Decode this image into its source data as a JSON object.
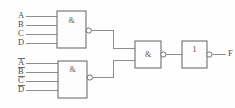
{
  "diagram": {
    "background_color": "#fefefe",
    "wire_color": "#8e8e8e",
    "gate_border_color": "#6f6f6f",
    "label_color": "#4a4a4a"
  },
  "gates": {
    "nand_top": {
      "symbol": "&",
      "name": "top-nand-gate",
      "inverted_output": true
    },
    "nand_bottom": {
      "symbol": "&",
      "name": "bottom-nand-gate",
      "inverted_output": true
    },
    "nand_mid": {
      "symbol": "&",
      "name": "middle-nand-gate",
      "inverted_output": true
    },
    "buffer_out": {
      "symbol": "1",
      "name": "output-buffer-gate",
      "inverted_output": true
    }
  },
  "inputs": {
    "top_group": [
      {
        "label": "A",
        "complement": false
      },
      {
        "label": "B",
        "complement": false
      },
      {
        "label": "C",
        "complement": false
      },
      {
        "label": "D",
        "complement": false
      }
    ],
    "bottom_group": [
      {
        "label": "A",
        "complement": true
      },
      {
        "label": "B",
        "complement": true
      },
      {
        "label": "C",
        "complement": true
      },
      {
        "label": "D",
        "complement": true
      }
    ]
  },
  "outputs": {
    "final": {
      "label": "F",
      "complement": false
    }
  }
}
